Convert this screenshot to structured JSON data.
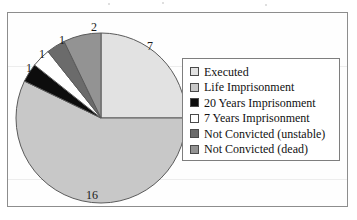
{
  "chart_data": {
    "type": "pie",
    "title": "",
    "total": 28,
    "legend_position": "right",
    "categories": [
      "Executed",
      "Life Imprisonment",
      "20 Years Imprisonment",
      "7 Years Imprisonment",
      "Not Convicted (unstable)",
      "Not Convicted (dead)"
    ],
    "values": [
      7,
      16,
      1,
      1,
      1,
      2
    ],
    "data_labels": [
      "7",
      "16",
      "1",
      "1",
      "1",
      "2"
    ],
    "colors": [
      "#e2e2e2",
      "#c8c8c8",
      "#0d0d0d",
      "#ffffff",
      "#6b6b6b",
      "#939393"
    ],
    "slice_order": "clockwise from 12 o'clock",
    "slices": [
      {
        "label": "Executed",
        "value": 7,
        "data_label": "7",
        "color": "#e2e2e2"
      },
      {
        "label": "Life Imprisonment",
        "value": 16,
        "data_label": "16",
        "color": "#c8c8c8"
      },
      {
        "label": "20 Years Imprisonment",
        "value": 1,
        "data_label": "1",
        "color": "#0d0d0d"
      },
      {
        "label": "7 Years Imprisonment",
        "value": 1,
        "data_label": "1",
        "color": "#ffffff"
      },
      {
        "label": "Not Convicted (unstable)",
        "value": 1,
        "data_label": "1",
        "color": "#6b6b6b"
      },
      {
        "label": "Not Convicted (dead)",
        "value": 2,
        "data_label": "2",
        "color": "#939393"
      }
    ]
  },
  "legend": {
    "items": [
      {
        "label": "Executed"
      },
      {
        "label": "Life Imprisonment"
      },
      {
        "label": "20 Years Imprisonment"
      },
      {
        "label": "7 Years Imprisonment"
      },
      {
        "label": "Not Convicted (unstable)"
      },
      {
        "label": "Not Convicted (dead)"
      }
    ]
  },
  "labels": {
    "executed": "7",
    "life": "16",
    "twenty_years": "1",
    "seven_years": "1",
    "unstable": "1",
    "dead": "2"
  },
  "style": {
    "frame_color": "#8d8d8d",
    "legend_border": "#7e7e7e",
    "slice_outline": "#5a5a5a",
    "text_color": "#111111"
  }
}
